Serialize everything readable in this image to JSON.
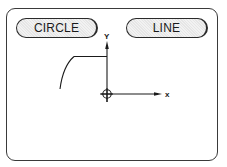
{
  "panel": {
    "buttons": [
      {
        "label": "CIRCLE"
      },
      {
        "label": "LINE"
      }
    ]
  },
  "drawing": {
    "y_axis_label": "Y",
    "x_axis_label": "x",
    "origin_symbol": "crosshair-circle",
    "stroke_color": "#1a1a1a"
  }
}
